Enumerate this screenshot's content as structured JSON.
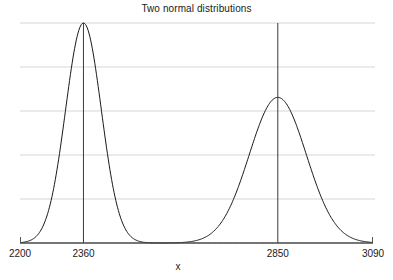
{
  "chart_data": {
    "type": "line",
    "title": "Two normal distributions",
    "xlabel": "x",
    "ylabel": "",
    "xlim": [
      2200,
      3090
    ],
    "ylim": [
      0,
      1.0
    ],
    "grid": true,
    "grid_lines_y": [
      0.2,
      0.4,
      0.6,
      0.8,
      1.0
    ],
    "legend": "none",
    "xticks": [
      2200,
      2360,
      2850,
      3090
    ],
    "xticklabels": [
      "2200",
      "2360",
      "2850",
      "3090"
    ],
    "yticks": [],
    "yticklabels": [],
    "annotations": [
      {
        "name": "mean-line-1",
        "x": 2360,
        "label": "2360"
      },
      {
        "name": "mean-line-2",
        "x": 2850,
        "label": "2850"
      }
    ],
    "series": [
      {
        "name": "distribution-1",
        "mean": 2360,
        "sigma": 45,
        "peak_height": 1.0,
        "color": "#1a1a1a"
      },
      {
        "name": "distribution-2",
        "mean": 2850,
        "sigma": 72,
        "peak_height": 0.662,
        "color": "#1a1a1a"
      }
    ]
  },
  "axis": {
    "tick_2200": "2200",
    "tick_2360": "2360",
    "tick_2850": "2850",
    "tick_3090": "3090",
    "x_axis_label": "x"
  },
  "colors": {
    "background": "#ffffff",
    "curve": "#1a1a1a",
    "gridline": "#d6d6d6",
    "axis": "#555555",
    "mean_line": "#3a3a3a",
    "text": "#1a1a1a"
  },
  "title": "Two normal distributions"
}
